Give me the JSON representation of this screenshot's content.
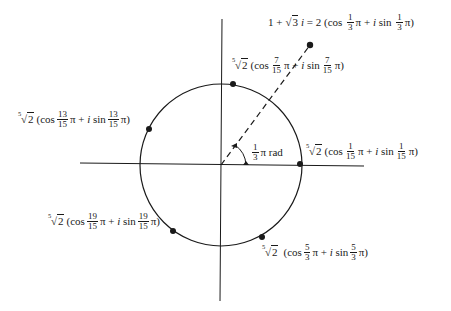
{
  "diagram": {
    "center": [
      221,
      165
    ],
    "radius": 81,
    "axes": {
      "horizontal": {
        "from": [
          80,
          163
        ],
        "to": [
          364,
          166
        ]
      },
      "vertical": {
        "from": [
          222,
          19
        ],
        "to": [
          220,
          301
        ]
      }
    },
    "angle_label": {
      "num": "1",
      "den": "3",
      "text": "π rad"
    },
    "source_point": {
      "position": [
        310,
        45
      ],
      "lhs": "1 + ",
      "sqrt_arg": "3",
      "i": "i",
      "eq": " = 2 (cos ",
      "frac": {
        "num": "1",
        "den": "3"
      },
      "mid": "π + ",
      "sin": " sin ",
      "tail": "π)"
    },
    "roots": [
      {
        "id": "k0",
        "position": [
          300,
          164
        ],
        "index": "5",
        "radicand": "2",
        "cos": "(cos",
        "num": "1",
        "den": "15",
        "mid": "π + ",
        "i": "i",
        "sin": " sin",
        "tail": "π)"
      },
      {
        "id": "k1",
        "position": [
          233,
          84
        ],
        "index": "5",
        "radicand": "2",
        "cos": "(cos",
        "num": "7",
        "den": "15",
        "mid": "π + ",
        "i": "i",
        "sin": " sin",
        "tail": "π)"
      },
      {
        "id": "k2",
        "position": [
          149,
          129
        ],
        "index": "5",
        "radicand": "2",
        "cos": "(cos",
        "num": "13",
        "den": "15",
        "mid": "π + ",
        "i": "i",
        "sin": " sin",
        "tail": "π)"
      },
      {
        "id": "k3",
        "position": [
          173,
          231
        ],
        "index": "5",
        "radicand": "2",
        "cos": "(cos",
        "num": "19",
        "den": "15",
        "mid": "π + ",
        "i": "i",
        "sin": " sin",
        "tail": "π)"
      },
      {
        "id": "k4",
        "position": [
          262,
          237
        ],
        "index": "5",
        "radicand": "2",
        "cos": "(cos",
        "num": "5",
        "den": "3",
        "mid": "π + ",
        "i": "i",
        "sin": " sin",
        "tail": "π)"
      }
    ]
  }
}
